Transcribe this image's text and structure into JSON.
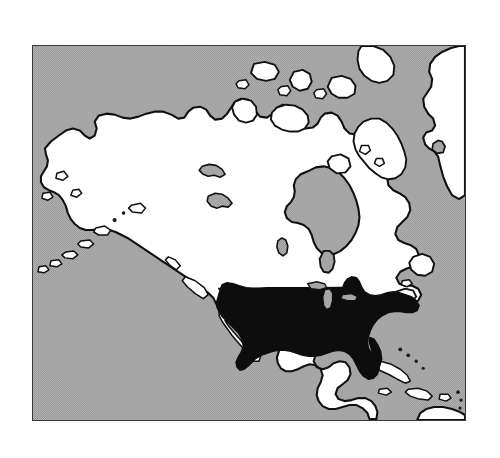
{
  "figure": {
    "type": "locator-map",
    "region_depicted": "North America",
    "projection_hint": "conic",
    "frame": {
      "x": 32,
      "y": 45,
      "width": 434,
      "height": 376,
      "border_color": "#3a3a3a",
      "border_width_px": 1.5
    }
  },
  "legend_semantics": {
    "highlight": {
      "label": "United States",
      "color": "#0d0d0d",
      "style": "solid black fill"
    },
    "other_land": {
      "label": "Other land",
      "color": "#ffffff",
      "style": "white fill with black outline"
    },
    "water": {
      "label": "Water",
      "color": "#aaaaaa",
      "style": "gray halftone / dither"
    },
    "page_background": {
      "label": "Page background",
      "color": "#ffffff"
    }
  },
  "colors": {
    "ocean_gray": "#aaaaaa",
    "ocean_dither_dark": "#8f8f8f",
    "land_white": "#ffffff",
    "coastline_black": "#111111",
    "highlight_black": "#0d0d0d",
    "frame_gray": "#3a3a3a"
  },
  "features": {
    "highlighted": [
      "United States (contiguous 48 states)"
    ],
    "land_masses": [
      "Alaska",
      "Canada",
      "Greenland (west coast)",
      "Mexico",
      "Central America",
      "Cuba",
      "Hispaniola",
      "Puerto Rico",
      "Lesser Antilles",
      "Bahamas",
      "Aleutian Islands",
      "Baffin Island",
      "Victoria Island",
      "Ellesmere Island",
      "Banks Island",
      "Newfoundland",
      "Vancouver Island"
    ],
    "water_bodies": [
      "Pacific Ocean",
      "Atlantic Ocean",
      "Arctic Ocean",
      "Hudson Bay",
      "Gulf of Mexico",
      "Gulf of California",
      "Caribbean Sea",
      "Great Lakes",
      "Great Slave Lake",
      "Great Bear Lake",
      "Lake Winnipeg"
    ]
  },
  "labels": {
    "visible_text": []
  }
}
